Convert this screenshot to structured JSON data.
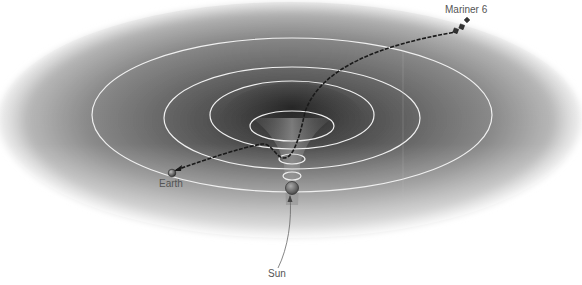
{
  "diagram": {
    "labels": {
      "spacecraft": "Mariner 6",
      "earth": "Earth",
      "sun": "Sun"
    },
    "colors": {
      "background": "#ffffff",
      "disk_dark": "#4a4a4a",
      "disk_light": "#e8e8e8",
      "orbit": "#f2f2f2",
      "trajectory": "#1a1a1a",
      "label_text": "#555555"
    },
    "orbit_count": 4,
    "trajectory_style": "dashed"
  }
}
